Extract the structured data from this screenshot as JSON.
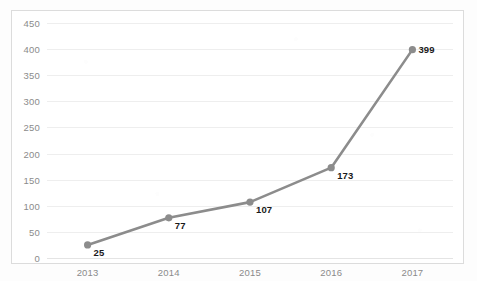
{
  "chart_data": {
    "type": "line",
    "title": "",
    "subtitle": "",
    "xlabel": "",
    "ylabel": "",
    "categories": [
      "2013",
      "2014",
      "2015",
      "2016",
      "2017"
    ],
    "values": [
      25,
      77,
      107,
      173,
      399
    ],
    "series": [
      {
        "name": "",
        "values": [
          25,
          77,
          107,
          173,
          399
        ]
      }
    ],
    "data_labels": [
      "25",
      "77",
      "107",
      "173",
      "399"
    ],
    "ylim": [
      0,
      450
    ],
    "ytick_labels": [
      "0",
      "50",
      "100",
      "150",
      "200",
      "250",
      "300",
      "350",
      "400",
      "450"
    ],
    "ytick_values": [
      0,
      50,
      100,
      150,
      200,
      250,
      300,
      350,
      400,
      450
    ],
    "xtick_labels": [
      "2013",
      "2014",
      "2015",
      "2016",
      "2017"
    ],
    "grid": true,
    "grid_axis": "y",
    "legend": false,
    "legend_position": "none",
    "marker": "circle",
    "colors": {
      "line": "#8c8c8c",
      "marker": "#8c8c8c",
      "grid": "#eeeeee",
      "axis": "#e4e4e4",
      "tick_text": "#8b8b8b",
      "label_text": "#1a1a1a",
      "border": "#dcdcdc",
      "plot_background": "#ffffff"
    }
  }
}
